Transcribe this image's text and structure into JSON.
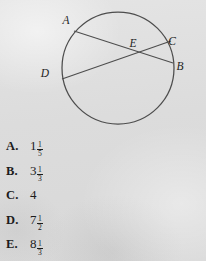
{
  "figure": {
    "name": "circle-with-two-intersecting-chords",
    "circle": {
      "cx": 118,
      "cy": 68,
      "r": 56
    },
    "point_labels": [
      {
        "id": "A",
        "text": "A",
        "x": 66,
        "y": 24
      },
      {
        "id": "E",
        "text": "E",
        "x": 133,
        "y": 47
      },
      {
        "id": "C",
        "text": "C",
        "x": 172,
        "y": 45
      },
      {
        "id": "D",
        "text": "D",
        "x": 45,
        "y": 77
      },
      {
        "id": "B",
        "text": "B",
        "x": 180,
        "y": 70
      }
    ],
    "chords": [
      {
        "id": "AB",
        "from": "A",
        "to": "B",
        "x1": 74,
        "y1": 31,
        "x2": 173,
        "y2": 63
      },
      {
        "id": "DC",
        "from": "D",
        "to": "C",
        "x1": 62,
        "y1": 79,
        "x2": 171,
        "y2": 41
      }
    ],
    "intersection_label": "E"
  },
  "choices": [
    {
      "letter": "A.",
      "whole": "1",
      "numerator": "1",
      "denominator": "5",
      "display": "1 1/5"
    },
    {
      "letter": "B.",
      "whole": "3",
      "numerator": "1",
      "denominator": "3",
      "display": "3 1/3"
    },
    {
      "letter": "C.",
      "whole": "4",
      "numerator": "",
      "denominator": "",
      "display": "4"
    },
    {
      "letter": "D.",
      "whole": "7",
      "numerator": "1",
      "denominator": "2",
      "display": "7 1/2"
    },
    {
      "letter": "E.",
      "whole": "8",
      "numerator": "1",
      "denominator": "3",
      "display": "8 1/3"
    }
  ],
  "colors": {
    "paper": "#dedede",
    "ink": "#1c1c1c",
    "line": "#4a4a4a"
  }
}
